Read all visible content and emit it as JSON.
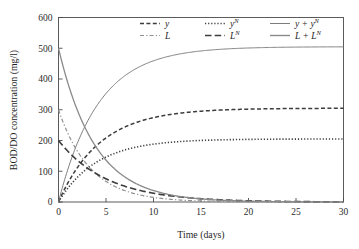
{
  "chart_data": {
    "type": "line",
    "title": "",
    "xlabel": "Time (days)",
    "ylabel": "BOD/DO concentration (mg/l)",
    "xlim": [
      0,
      30
    ],
    "ylim": [
      0,
      600
    ],
    "xticks": [
      0,
      5,
      10,
      15,
      20,
      25,
      30
    ],
    "yticks": [
      0,
      100,
      200,
      300,
      400,
      500,
      600
    ],
    "xtick_labels": [
      "0",
      "5",
      "10",
      "15",
      "20",
      "25",
      "30"
    ],
    "ytick_labels": [
      "0",
      "100",
      "200",
      "300",
      "400",
      "500",
      "600"
    ],
    "grid": false,
    "legend_position": "upper-center",
    "x": [
      0,
      0.5,
      1,
      1.5,
      2,
      2.5,
      3,
      3.5,
      4,
      4.5,
      5,
      6,
      7,
      8,
      9,
      10,
      11,
      12,
      13,
      14,
      15,
      16,
      17,
      18,
      20,
      22,
      24,
      26,
      28,
      30
    ],
    "series": [
      {
        "name": "y",
        "label": "y",
        "style": "dashed",
        "color": "#3d3d3d",
        "width": 1.5,
        "dash": "4,2.4",
        "initial": 0,
        "asymptote": 305,
        "rate": 0.23,
        "values": [
          0,
          33.2,
          62.8,
          89.2,
          112.7,
          133.7,
          152.4,
          169.1,
          184.0,
          197.3,
          209.1,
          228.9,
          244.6,
          257.1,
          267.0,
          274.9,
          281.2,
          286.2,
          290.2,
          293.3,
          295.9,
          297.9,
          299.5,
          300.8,
          302.6,
          303.8,
          304.5,
          304.9,
          305.2,
          305.4
        ]
      },
      {
        "name": "y_N",
        "label": "yN",
        "style": "dotted",
        "color": "#3d3d3d",
        "width": 1.6,
        "dash": "1.2,1.9",
        "initial": 0,
        "asymptote": 205,
        "rate": 0.25,
        "values": [
          0,
          24.1,
          45.4,
          64.2,
          80.8,
          95.5,
          108.4,
          119.9,
          130.0,
          138.9,
          146.8,
          159.7,
          169.7,
          177.6,
          183.7,
          188.5,
          192.2,
          195.1,
          197.4,
          199.2,
          200.6,
          201.7,
          202.5,
          203.2,
          204.0,
          204.5,
          204.7,
          204.9,
          204.9,
          205.0
        ]
      },
      {
        "name": "y_plus_yN",
        "label": "y + yN",
        "style": "solid",
        "color": "#7d7d7d",
        "width": 1.0,
        "dash": "",
        "initial": 0,
        "asymptote": 505,
        "rate": 0.24,
        "values": [
          0,
          57.3,
          108.2,
          153.4,
          193.5,
          229.2,
          260.8,
          289.0,
          314.0,
          336.2,
          355.9,
          388.6,
          414.3,
          434.7,
          450.7,
          463.4,
          473.4,
          481.3,
          487.6,
          492.5,
          496.5,
          499.6,
          502.0,
          504.0,
          506.6,
          508.3,
          509.2,
          509.8,
          510.1,
          510.4
        ]
      },
      {
        "name": "L",
        "label": "L",
        "style": "dash-dot",
        "color": "#8f8f8f",
        "width": 1.2,
        "dash": "4,2.2,1.2,2.2",
        "initial": 300,
        "asymptote": 0,
        "rate": 0.3,
        "values": [
          300,
          258.2,
          222.2,
          191.2,
          164.6,
          141.7,
          122.0,
          105.0,
          90.4,
          77.8,
          67.0,
          49.6,
          36.7,
          27.2,
          20.2,
          14.9,
          11.1,
          8.2,
          6.1,
          4.5,
          3.3,
          2.5,
          1.8,
          1.4,
          0.7,
          0.4,
          0.2,
          0.1,
          0.1,
          0.0
        ]
      },
      {
        "name": "L_N",
        "label": "LN",
        "style": "long-dash",
        "color": "#3d3d3d",
        "width": 1.6,
        "dash": "6.5,3.2",
        "initial": 200,
        "asymptote": 0,
        "rate": 0.195,
        "values": [
          200,
          181.4,
          164.5,
          149.2,
          135.3,
          122.7,
          111.3,
          100.9,
          91.5,
          83.0,
          75.3,
          61.9,
          50.9,
          41.9,
          34.4,
          28.3,
          23.3,
          19.2,
          15.8,
          13.0,
          10.7,
          8.8,
          7.2,
          5.9,
          4.0,
          2.7,
          1.8,
          1.2,
          0.8,
          0.6
        ]
      },
      {
        "name": "L_plus_LN",
        "label": "L + LN",
        "style": "solid",
        "color": "#8a8a8a",
        "width": 1.3,
        "dash": "",
        "initial": 500,
        "asymptote": 0,
        "rate": 0.26,
        "values": [
          500,
          439.6,
          386.7,
          340.4,
          299.9,
          264.4,
          233.3,
          205.9,
          181.9,
          160.8,
          142.3,
          111.5,
          87.6,
          69.1,
          54.6,
          43.2,
          34.4,
          27.4,
          21.9,
          17.5,
          14.0,
          11.3,
          9.0,
          7.3,
          4.7,
          3.1,
          2.0,
          1.3,
          0.9,
          0.6
        ]
      }
    ],
    "legend": [
      {
        "label": "y",
        "sup": "",
        "style": "dashed",
        "col": 0,
        "row": 0
      },
      {
        "label": "yN",
        "sup": "N",
        "style": "dotted",
        "col": 1,
        "row": 0
      },
      {
        "label": "y + yN",
        "sup": "N",
        "style": "solid-thin",
        "col": 2,
        "row": 0
      },
      {
        "label": "L",
        "sup": "",
        "style": "dash-dot",
        "col": 0,
        "row": 1
      },
      {
        "label": "LN",
        "sup": "N",
        "style": "long-dash",
        "col": 1,
        "row": 1
      },
      {
        "label": "L + LN",
        "sup": "N",
        "style": "solid-thick",
        "col": 2,
        "row": 1
      }
    ]
  }
}
